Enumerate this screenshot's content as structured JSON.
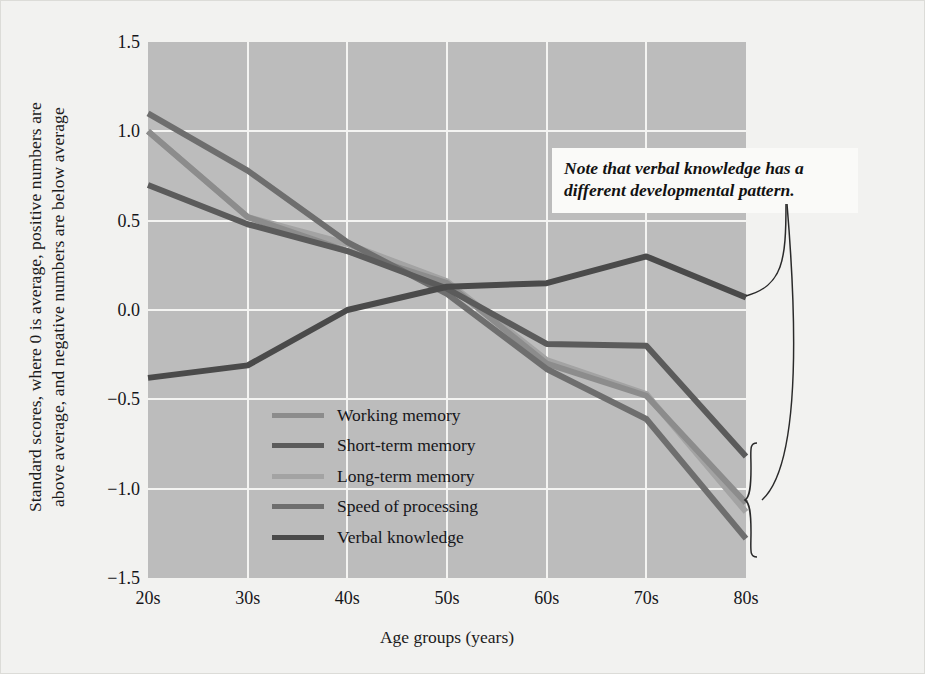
{
  "figure": {
    "background_color": "#f2f2f0",
    "plot_background_color": "#bcbcbc",
    "grid_color": "#f4f4f2"
  },
  "chart_data": {
    "type": "line",
    "title": "",
    "xlabel": "Age groups (years)",
    "ylabel_line1": "Standard scores, where 0 is average, positive numbers are",
    "ylabel_line2": "above average, and negative numbers are below average",
    "categories": [
      "20s",
      "30s",
      "40s",
      "50s",
      "60s",
      "70s",
      "80s"
    ],
    "x": [
      20,
      30,
      40,
      50,
      60,
      70,
      80
    ],
    "xlim": [
      20,
      80
    ],
    "ylim": [
      -1.5,
      1.5
    ],
    "yticks": [
      "1.5",
      "1.0",
      "0.5",
      "0.0",
      "-0.5",
      "-1.0",
      "-1.5"
    ],
    "ytick_values": [
      1.5,
      1.0,
      0.5,
      0.0,
      -0.5,
      -1.0,
      -1.5
    ],
    "grid": true,
    "legend_position": "center-left-inside",
    "series": [
      {
        "name": "Working memory",
        "color": "#8c8c8c",
        "values": [
          1.0,
          0.52,
          0.33,
          0.15,
          -0.3,
          -0.48,
          -1.08
        ]
      },
      {
        "name": "Short-term memory",
        "color": "#5b5b5b",
        "values": [
          0.7,
          0.48,
          0.33,
          0.12,
          -0.19,
          -0.2,
          -0.82
        ]
      },
      {
        "name": "Long-term memory",
        "color": "#a3a3a3",
        "values": [
          1.0,
          0.52,
          0.37,
          0.16,
          -0.28,
          -0.47,
          -1.13
        ]
      },
      {
        "name": "Speed of processing",
        "color": "#6e6e6e",
        "values": [
          1.1,
          0.78,
          0.38,
          0.09,
          -0.33,
          -0.61,
          -1.28
        ]
      },
      {
        "name": "Verbal knowledge",
        "color": "#4a4a4a",
        "values": [
          -0.38,
          -0.31,
          0.0,
          0.13,
          0.15,
          0.3,
          0.07
        ]
      }
    ],
    "annotations": [
      {
        "name": "verbal-knowledge-note",
        "line1": "Note that verbal knowledge has a",
        "line2": "different developmental pattern.",
        "style": "bold-italic",
        "background": "#fafaf8"
      }
    ]
  }
}
